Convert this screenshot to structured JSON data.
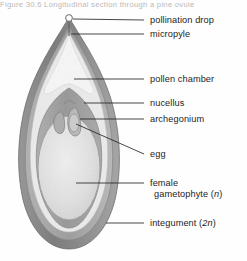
{
  "figure": {
    "title_strip": "Figure 30.6   Longitudinal section through a pine ovule",
    "colors": {
      "integument_outer": "#8f8f8f",
      "integument_mid": "#a8a8a8",
      "integument_inner": "#bdbdbd",
      "nucellus": "#9d9d9d",
      "pollen_chamber": "#f7f7f7",
      "gametophyte": "#e4e4e4",
      "archegonium": "#b6b6b6",
      "leader_line": "#2a2a2a",
      "text": "#1d1d1d",
      "background": "#ffffff"
    }
  },
  "labels": [
    {
      "id": "pollination-drop",
      "text": "pollination drop",
      "x": 152,
      "y": 16,
      "leader": {
        "x1": 144,
        "y1": 20,
        "x2": 73,
        "y2": 20
      }
    },
    {
      "id": "micropyle",
      "text": "micropyle",
      "x": 152,
      "y": 30,
      "leader": {
        "x1": 144,
        "y1": 34,
        "x2": 73,
        "y2": 34
      }
    },
    {
      "id": "pollen-chamber",
      "text": "pollen chamber",
      "x": 152,
      "y": 75,
      "leader": {
        "x1": 144,
        "y1": 79,
        "x2": 73,
        "y2": 79
      }
    },
    {
      "id": "nucellus",
      "text": "nucellus",
      "x": 152,
      "y": 99,
      "leader": {
        "x1": 144,
        "y1": 103,
        "x2": 82,
        "y2": 103
      }
    },
    {
      "id": "archegonium",
      "text": "archegonium",
      "x": 152,
      "y": 115,
      "leader": {
        "x1": 144,
        "y1": 119,
        "x2": 79,
        "y2": 119
      }
    },
    {
      "id": "egg",
      "text": "egg",
      "x": 152,
      "y": 150,
      "leader": {
        "x1": 144,
        "y1": 154,
        "x2": 77,
        "y2": 122
      }
    },
    {
      "id": "female-gametophyte",
      "text": "female",
      "text2": "gametophyte (",
      "italic": "n",
      "text3": ")",
      "x": 152,
      "y": 179,
      "leader": {
        "x1": 144,
        "y1": 183,
        "x2": 76,
        "y2": 183
      }
    },
    {
      "id": "integument",
      "text": "integument (",
      "italic": "2n",
      "text3": ")",
      "x": 152,
      "y": 219,
      "leader": {
        "x1": 144,
        "y1": 223,
        "x2": 107,
        "y2": 223
      }
    }
  ],
  "structures": [
    {
      "id": "outer-integument",
      "label": "integument (2n)"
    },
    {
      "id": "nucellus-tissue",
      "label": "nucellus"
    },
    {
      "id": "pollen-chamber-cavity",
      "label": "pollen chamber"
    },
    {
      "id": "female-gametophyte-body",
      "label": "female gametophyte (n)"
    },
    {
      "id": "archegonium-left",
      "label": "archegonium"
    },
    {
      "id": "archegonium-right",
      "label": "archegonium"
    },
    {
      "id": "egg-cell",
      "label": "egg"
    },
    {
      "id": "micropyle-canal",
      "label": "micropyle"
    },
    {
      "id": "pollination-drop-bead",
      "label": "pollination drop"
    }
  ]
}
